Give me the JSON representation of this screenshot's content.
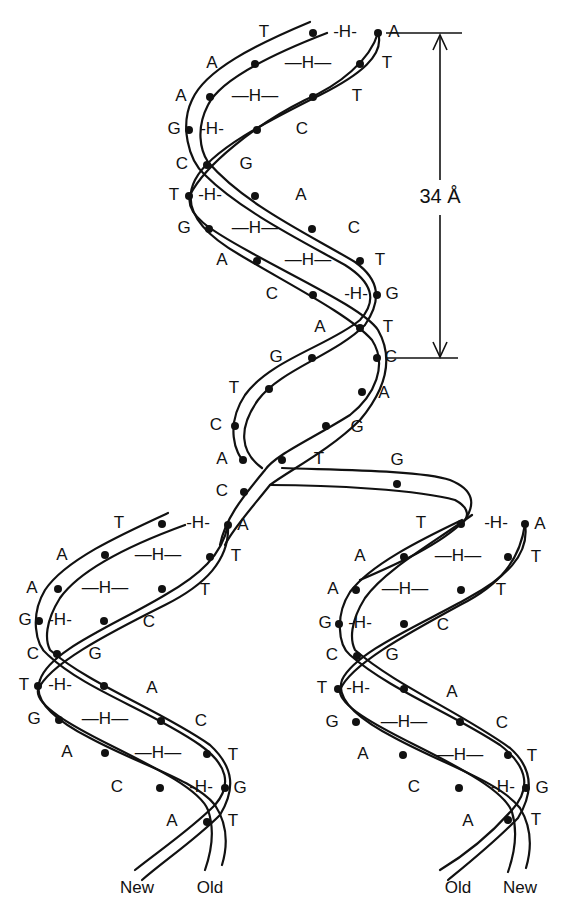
{
  "figure": {
    "colors": {
      "ink": "#111111",
      "background": "#ffffff"
    },
    "measurement": {
      "label": "34 Å",
      "value": 34,
      "unit": "Å",
      "description": "one helical turn"
    },
    "hydrogen_bond_label": "-H-",
    "parent_helix": {
      "left_bases": [
        "T",
        "A",
        "A",
        "G",
        "C",
        "T",
        "G",
        "A",
        "C",
        "A",
        "G",
        "T",
        "C",
        "A",
        "C"
      ],
      "right_bases": [
        "A",
        "T",
        "T",
        "C",
        "G",
        "A",
        "C",
        "T",
        "G",
        "T",
        "C",
        "A",
        "G",
        "T",
        "G"
      ],
      "pairs": [
        {
          "left": "T",
          "right": "A"
        },
        {
          "left": "A",
          "right": "T"
        },
        {
          "left": "A",
          "right": "T"
        },
        {
          "left": "G",
          "right": "C"
        },
        {
          "left": "C",
          "right": "G"
        },
        {
          "left": "T",
          "right": "A"
        },
        {
          "left": "G",
          "right": "C"
        },
        {
          "left": "A",
          "right": "T"
        },
        {
          "left": "C",
          "right": "G"
        },
        {
          "left": "A",
          "right": "T"
        },
        {
          "left": "G",
          "right": "C"
        }
      ]
    },
    "daughter_left": {
      "pairs": [
        {
          "left": "T",
          "right": "A"
        },
        {
          "left": "A",
          "right": "T"
        },
        {
          "left": "A",
          "right": "T"
        },
        {
          "left": "G",
          "right": "C"
        },
        {
          "left": "C",
          "right": "G"
        },
        {
          "left": "T",
          "right": "A"
        },
        {
          "left": "G",
          "right": "C"
        },
        {
          "left": "A",
          "right": "T"
        },
        {
          "left": "C",
          "right": "G"
        },
        {
          "left": "A",
          "right": "T"
        }
      ],
      "strand_labels": [
        "New",
        "Old"
      ]
    },
    "daughter_right": {
      "pairs": [
        {
          "left": "T",
          "right": "A"
        },
        {
          "left": "A",
          "right": "T"
        },
        {
          "left": "A",
          "right": "T"
        },
        {
          "left": "G",
          "right": "C"
        },
        {
          "left": "C",
          "right": "G"
        },
        {
          "left": "T",
          "right": "A"
        },
        {
          "left": "G",
          "right": "C"
        },
        {
          "left": "A",
          "right": "T"
        },
        {
          "left": "C",
          "right": "G"
        },
        {
          "left": "A",
          "right": "T"
        }
      ],
      "strand_labels": [
        "Old",
        "New"
      ]
    },
    "labels": {
      "p": {
        "T1": "T",
        "H1": "-H-",
        "A1": "A",
        "A2": "A",
        "H2": "—H—",
        "T2": "T",
        "A3": "A",
        "H3": "—H—",
        "T3": "T",
        "G4": "G",
        "H4": "-H-",
        "C4": "C",
        "C5": "C",
        "G5": "G",
        "T6": "T",
        "H6": "-H-",
        "A6": "A",
        "G7": "G",
        "H7": "—H—",
        "C7": "C",
        "A8": "A",
        "H8": "—H—",
        "T8": "T",
        "C9": "C",
        "H9": "-H-",
        "G9": "G",
        "A10": "A",
        "T10": "T",
        "G11": "G",
        "C11": "C",
        "T12": "T",
        "A12": "A",
        "C13": "C",
        "G13": "G",
        "A14": "A",
        "T14": "T",
        "G14": "G",
        "C15": "C"
      },
      "l": {
        "T1": "T",
        "H1": "-H-",
        "A1": "A",
        "A2": "A",
        "H2": "—H—",
        "T2": "T",
        "A3": "A",
        "H3": "—H—",
        "T3": "T",
        "G4": "G",
        "H4": "-H-",
        "C4": "C",
        "C5": "C",
        "G5": "G",
        "T6": "T",
        "H6": "-H-",
        "A6": "A",
        "G7": "G",
        "H7": "—H—",
        "C7": "C",
        "A8": "A",
        "H8": "—H—",
        "T8": "T",
        "C9": "C",
        "H9": "-H-",
        "G9": "G",
        "A10": "A",
        "T10": "T",
        "new": "New",
        "old": "Old"
      },
      "r": {
        "T1": "T",
        "H1": "-H-",
        "A1": "A",
        "A2": "A",
        "H2": "—H—",
        "T2": "T",
        "A3": "A",
        "H3": "—H—",
        "T3": "T",
        "G4": "G",
        "H4": "-H-",
        "C4": "C",
        "C5": "C",
        "G5": "G",
        "T6": "T",
        "H6": "-H-",
        "A6": "A",
        "G7": "G",
        "H7": "—H—",
        "C7": "C",
        "A8": "A",
        "H8": "—H—",
        "T8": "T",
        "C9": "C",
        "H9": "-H-",
        "G9": "G",
        "A10": "A",
        "T10": "T",
        "old": "Old",
        "new": "New"
      }
    }
  }
}
